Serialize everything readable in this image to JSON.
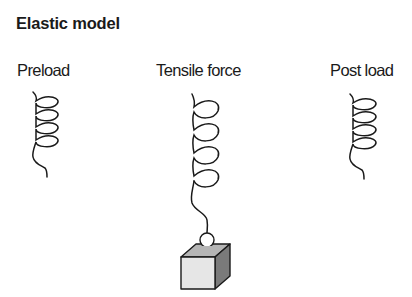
{
  "title": "Elastic model",
  "states": [
    {
      "id": "preload",
      "label": "Preload"
    },
    {
      "id": "tensile",
      "label": "Tensile force"
    },
    {
      "id": "postload",
      "label": "Post load"
    }
  ],
  "colors": {
    "line": "#1a1a1a",
    "cube_front": "#e6e6e6",
    "cube_top": "#b5b5b5",
    "cube_side": "#7a7a7a"
  }
}
